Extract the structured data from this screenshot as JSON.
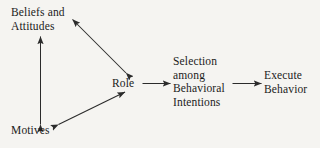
{
  "diagram": {
    "background_color": "#f5f4f1",
    "stroke_color": "#2b2b2b",
    "text_color": "#1b1b1b",
    "nodes": [
      {
        "id": "beliefs",
        "lines": [
          "Beliefs and",
          "Attitudes"
        ],
        "line1": "Beliefs and",
        "line2": "Attitudes"
      },
      {
        "id": "motives",
        "lines": [
          "Motives"
        ],
        "line1": "Motives"
      },
      {
        "id": "role",
        "lines": [
          "Role"
        ],
        "line1": "Role"
      },
      {
        "id": "selection",
        "lines": [
          "Selection",
          "among",
          "Behavioral",
          "Intentions"
        ],
        "line1": "Selection",
        "line2": "among",
        "line3": "Behavioral",
        "line4": "Intentions"
      },
      {
        "id": "execute",
        "lines": [
          "Execute",
          "Behavior"
        ],
        "line1": "Execute",
        "line2": "Behavior"
      }
    ],
    "edges": [
      {
        "id": "beliefs-motives",
        "from": "beliefs",
        "to": "motives",
        "direction": "bidirectional"
      },
      {
        "id": "beliefs-role",
        "from": "beliefs",
        "to": "role",
        "direction": "bidirectional"
      },
      {
        "id": "motives-role",
        "from": "motives",
        "to": "role",
        "direction": "bidirectional"
      },
      {
        "id": "role-selection",
        "from": "role",
        "to": "selection",
        "direction": "unidirectional"
      },
      {
        "id": "selection-execute",
        "from": "selection",
        "to": "execute",
        "direction": "unidirectional"
      }
    ]
  }
}
